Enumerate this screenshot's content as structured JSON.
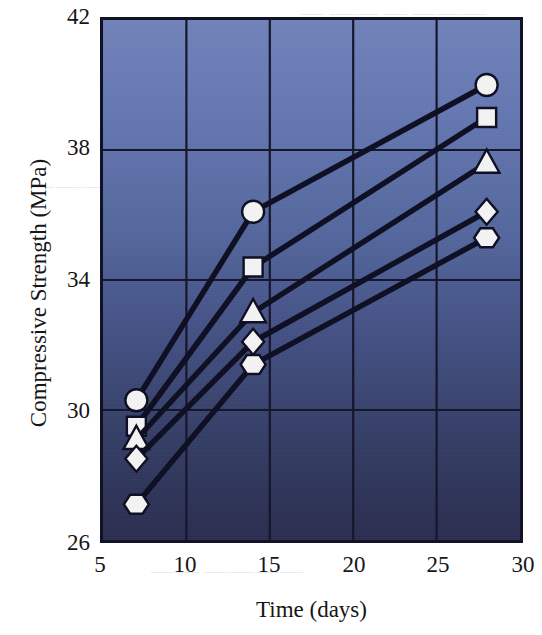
{
  "chart_data": {
    "type": "line",
    "title": "",
    "xlabel": "Time (days)",
    "ylabel": "Compressive Strength (MPa)",
    "xlim": [
      5,
      30
    ],
    "ylim": [
      26,
      42
    ],
    "xticks": [
      5,
      10,
      15,
      20,
      25,
      30
    ],
    "yticks": [
      26,
      30,
      34,
      38,
      42
    ],
    "grid": true,
    "legend": "none",
    "x": [
      7,
      14,
      28
    ],
    "series": [
      {
        "name": "Series 1",
        "marker": "circle",
        "values": [
          30.3,
          36.1,
          40.0
        ]
      },
      {
        "name": "Series 2",
        "marker": "square",
        "values": [
          29.5,
          34.4,
          39.0
        ]
      },
      {
        "name": "Series 3",
        "marker": "triangle",
        "values": [
          29.1,
          33.0,
          37.6
        ]
      },
      {
        "name": "Series 4",
        "marker": "diamond",
        "values": [
          28.5,
          32.1,
          36.1
        ]
      },
      {
        "name": "Series 5",
        "marker": "hexagon",
        "values": [
          27.1,
          31.4,
          35.3
        ]
      }
    ],
    "colors": {
      "line": "#101024",
      "marker_fill": "#f2f2f2",
      "marker_edge": "#101024",
      "grid": "#16162c",
      "axis": "#121225",
      "plot_bg_top": "#7183bb",
      "plot_bg_bottom": "#2a2d50",
      "text": "#161616"
    }
  },
  "axis": {
    "y_tick_labels": [
      "42",
      "38",
      "34",
      "30",
      "26"
    ],
    "x_tick_labels": [
      "5",
      "10",
      "15",
      "20",
      "25",
      "30"
    ],
    "y_title": "Compressive Strength (MPa)",
    "x_title": "Time (days)"
  }
}
